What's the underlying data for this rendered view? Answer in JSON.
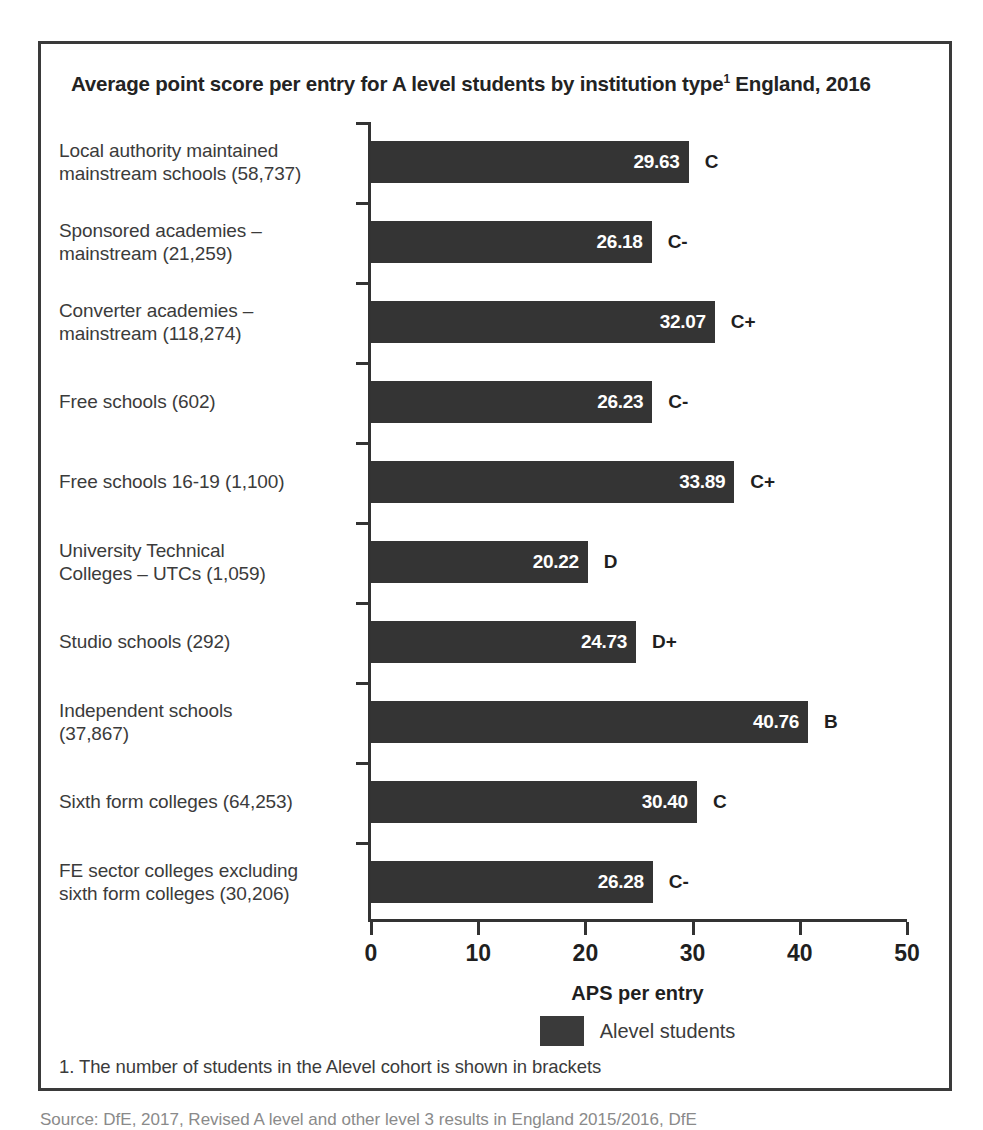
{
  "title": {
    "main": "Average point score per entry for A level students by institution type",
    "footnote_marker": "1",
    "suffix": " England, 2016"
  },
  "chart_data": {
    "type": "bar",
    "orientation": "horizontal",
    "xlabel": "APS per entry",
    "ylabel": "",
    "xlim": [
      0,
      50
    ],
    "xticks": [
      "0",
      "10",
      "20",
      "30",
      "40",
      "50"
    ],
    "grid": false,
    "legend_position": "bottom",
    "series": [
      {
        "name": "Alevel students",
        "color": "#343434",
        "values": [
          29.63,
          26.18,
          32.07,
          26.23,
          33.89,
          20.22,
          24.73,
          40.76,
          30.4,
          26.28
        ]
      }
    ],
    "categories": [
      "Local authority maintained mainstream schools (58,737)",
      "Sponsored academies – mainstream (21,259)",
      "Converter academies – mainstream (118,274)",
      "Free schools (602)",
      "Free schools 16-19 (1,100)",
      "University Technical Colleges – UTCs (1,059)",
      "Studio schools (292)",
      "Independent schools (37,867)",
      "Sixth form colleges (64,253)",
      "FE sector colleges excluding sixth form colleges (30,206)"
    ],
    "value_labels": [
      "29.63",
      "26.18",
      "32.07",
      "26.23",
      "33.89",
      "20.22",
      "24.73",
      "40.76",
      "30.40",
      "26.28"
    ],
    "annotations": [
      "C",
      "C-",
      "C+",
      "C-",
      "C+",
      "D",
      "D+",
      "B",
      "C",
      "C-"
    ]
  },
  "rows": [
    {
      "label_line1": "Local authority maintained",
      "label_line2": "mainstream schools (58,737)",
      "value": 29.63,
      "value_label": "29.63",
      "grade": "C"
    },
    {
      "label_line1": "Sponsored academies –",
      "label_line2": "mainstream (21,259)",
      "value": 26.18,
      "value_label": "26.18",
      "grade": "C-"
    },
    {
      "label_line1": "Converter academies –",
      "label_line2": "mainstream (118,274)",
      "value": 32.07,
      "value_label": "32.07",
      "grade": "C+"
    },
    {
      "label_line1": "Free schools (602)",
      "label_line2": "",
      "value": 26.23,
      "value_label": "26.23",
      "grade": "C-"
    },
    {
      "label_line1": "Free schools 16-19 (1,100)",
      "label_line2": "",
      "value": 33.89,
      "value_label": "33.89",
      "grade": "C+"
    },
    {
      "label_line1": "University Technical",
      "label_line2": "Colleges – UTCs (1,059)",
      "value": 20.22,
      "value_label": "20.22",
      "grade": "D"
    },
    {
      "label_line1": "Studio schools (292)",
      "label_line2": "",
      "value": 24.73,
      "value_label": "24.73",
      "grade": "D+"
    },
    {
      "label_line1": "Independent schools",
      "label_line2": "(37,867)",
      "value": 40.76,
      "value_label": "40.76",
      "grade": "B"
    },
    {
      "label_line1": "Sixth form colleges (64,253)",
      "label_line2": "",
      "value": 30.4,
      "value_label": "30.40",
      "grade": "C"
    },
    {
      "label_line1": "FE sector colleges excluding",
      "label_line2": "sixth form colleges (30,206)",
      "value": 26.28,
      "value_label": "26.28",
      "grade": "C-"
    }
  ],
  "x_axis": {
    "title": "APS per entry",
    "ticks": [
      "0",
      "10",
      "20",
      "30",
      "40",
      "50"
    ]
  },
  "legend": {
    "label": "Alevel students",
    "swatch_color": "#3a3a3a"
  },
  "footnote": "1. The number of students in the Alevel cohort is shown in brackets",
  "source": "Source: DfE, 2017, Revised A level and other level 3 results in England 2015/2016, DfE",
  "colors": {
    "bar": "#343434",
    "axis": "#333333",
    "frame": "#3a3a3a",
    "text": "#3b3b3b"
  }
}
